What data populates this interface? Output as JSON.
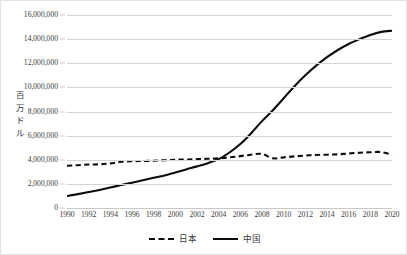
{
  "chart_data": {
    "type": "line",
    "title": "",
    "xlabel": "",
    "ylabel": "百万ドル",
    "ylim": [
      0,
      16000000
    ],
    "xlim": [
      1990,
      2020
    ],
    "grid": true,
    "legend_position": "bottom-center",
    "y_ticks": [
      "16,000,000",
      "14,000,000",
      "12,000,000",
      "10,000,000",
      "8,000,000",
      "6,000,000",
      "4,000,000",
      "2,000,000",
      "0"
    ],
    "y_tick_values": [
      16000000,
      14000000,
      12000000,
      10000000,
      8000000,
      6000000,
      4000000,
      2000000,
      0
    ],
    "x_tick_labels": [
      "1990",
      "1992",
      "1994",
      "1996",
      "1998",
      "2000",
      "2002",
      "2004",
      "2006",
      "2008",
      "2010",
      "2012",
      "2014",
      "2016",
      "2018",
      "2020"
    ],
    "x": [
      1990,
      1991,
      1992,
      1993,
      1994,
      1995,
      1996,
      1997,
      1998,
      1999,
      2000,
      2001,
      2002,
      2003,
      2004,
      2005,
      2006,
      2007,
      2008,
      2009,
      2010,
      2011,
      2012,
      2013,
      2014,
      2015,
      2016,
      2017,
      2018,
      2019,
      2020
    ],
    "series": [
      {
        "name": "日本",
        "style": "dashed",
        "color": "#0d0d0d",
        "values": [
          3500000,
          3550000,
          3600000,
          3620000,
          3700000,
          3830000,
          3880000,
          3900000,
          3920000,
          3960000,
          4000000,
          4020000,
          4050000,
          4080000,
          4120000,
          4200000,
          4300000,
          4420000,
          4480000,
          4120000,
          4200000,
          4280000,
          4350000,
          4400000,
          4420000,
          4450000,
          4520000,
          4580000,
          4620000,
          4640000,
          4420000
        ]
      },
      {
        "name": "中国",
        "style": "solid",
        "color": "#0d0d0d",
        "values": [
          1000000,
          1150000,
          1320000,
          1500000,
          1700000,
          1900000,
          2100000,
          2300000,
          2500000,
          2700000,
          2950000,
          3200000,
          3450000,
          3720000,
          4050000,
          4600000,
          5300000,
          6200000,
          7200000,
          8100000,
          9100000,
          10100000,
          11000000,
          11800000,
          12500000,
          13100000,
          13600000,
          14000000,
          14350000,
          14600000,
          14700000
        ]
      }
    ]
  },
  "legend": {
    "entries": [
      {
        "label": "日本",
        "style": "dashed"
      },
      {
        "label": "中国",
        "style": "solid"
      }
    ]
  },
  "axis_title": {
    "vertical_chars": [
      "百",
      "万",
      "ド",
      "ル"
    ]
  }
}
